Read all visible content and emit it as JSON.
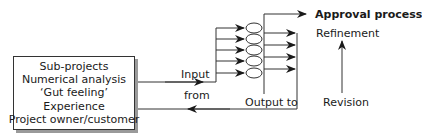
{
  "diagram": {
    "type": "process-flow",
    "source_box": {
      "lines": [
        "Sub-projects",
        "Numerical analysis",
        "‘Gut feeling’",
        "Experience",
        "Project owner/customer"
      ]
    },
    "labels": {
      "input": "Input",
      "from": "from",
      "output_to": "Output to",
      "approval": "Approval process",
      "refinement": "Refinement",
      "revision": "Revision"
    },
    "coil_count": 5,
    "output_arrow_count": 4,
    "colors": {
      "line": "#333333",
      "shadow": "#9a9a9a",
      "background": "#ffffff"
    }
  }
}
